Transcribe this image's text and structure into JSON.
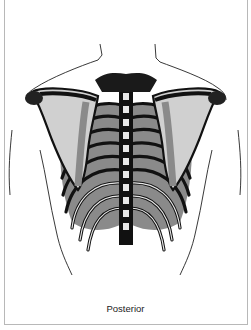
{
  "figure": {
    "caption": "Posterior",
    "colors": {
      "ink": "#111111",
      "shade": "#8a8a8a",
      "bone_light": "#e8e8e8",
      "frame_border": "#b8b8b8",
      "background": "#ffffff"
    }
  }
}
